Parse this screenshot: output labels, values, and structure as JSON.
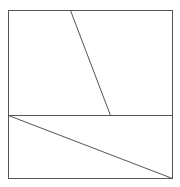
{
  "diagram": {
    "type": "geometry-figure",
    "canvas": {
      "width": 180,
      "height": 187,
      "background": "#ffffff"
    },
    "stroke": {
      "color": "#555555",
      "width": 1
    },
    "rectangle": {
      "x1": 8,
      "y1": 10,
      "x2": 172,
      "y2": 178
    },
    "segments": [
      {
        "name": "middle-horizontal-line",
        "x1": 8,
        "y1": 115,
        "x2": 172,
        "y2": 115
      },
      {
        "name": "upper-slant-line",
        "x1": 70,
        "y1": 10,
        "x2": 110,
        "y2": 115
      },
      {
        "name": "lower-diagonal-line",
        "x1": 8,
        "y1": 115,
        "x2": 172,
        "y2": 178
      }
    ],
    "labels": []
  }
}
